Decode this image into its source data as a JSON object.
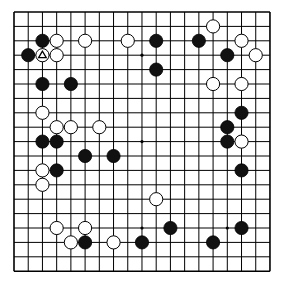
{
  "board": {
    "size": 19,
    "origin_x": 14,
    "origin_y": 12,
    "spacing_x": 14.22,
    "spacing_y": 14.4,
    "stone_radius": 6.6,
    "line_color": "#000000",
    "background": "#ffffff",
    "star_points": [
      [
        3,
        3
      ],
      [
        9,
        3
      ],
      [
        15,
        3
      ],
      [
        3,
        9
      ],
      [
        9,
        9
      ],
      [
        15,
        9
      ],
      [
        3,
        15
      ],
      [
        9,
        15
      ],
      [
        15,
        15
      ]
    ]
  },
  "stones": {
    "black": [
      [
        2,
        2
      ],
      [
        10,
        2
      ],
      [
        13,
        2
      ],
      [
        1,
        3
      ],
      [
        15,
        3
      ],
      [
        10,
        4
      ],
      [
        2,
        5
      ],
      [
        4,
        5
      ],
      [
        16,
        7
      ],
      [
        15,
        8
      ],
      [
        2,
        9
      ],
      [
        3,
        9
      ],
      [
        15,
        9
      ],
      [
        5,
        10
      ],
      [
        7,
        10
      ],
      [
        3,
        11
      ],
      [
        16,
        11
      ],
      [
        11,
        15
      ],
      [
        16,
        15
      ],
      [
        5,
        16
      ],
      [
        9,
        16
      ],
      [
        14,
        16
      ]
    ],
    "white": [
      [
        14,
        1
      ],
      [
        3,
        2
      ],
      [
        5,
        2
      ],
      [
        8,
        2
      ],
      [
        16,
        2
      ],
      [
        2,
        3
      ],
      [
        3,
        3
      ],
      [
        17,
        3
      ],
      [
        14,
        5
      ],
      [
        16,
        5
      ],
      [
        2,
        7
      ],
      [
        3,
        8
      ],
      [
        4,
        8
      ],
      [
        6,
        8
      ],
      [
        16,
        9
      ],
      [
        2,
        11
      ],
      [
        2,
        12
      ],
      [
        10,
        13
      ],
      [
        3,
        15
      ],
      [
        5,
        15
      ],
      [
        4,
        16
      ],
      [
        7,
        16
      ]
    ]
  },
  "markers": [
    {
      "type": "triangle",
      "col": 2,
      "row": 3,
      "on": "white"
    }
  ],
  "colors": {
    "black_stone": "#111111",
    "white_stone": "#ffffff",
    "stone_outline": "#000000"
  }
}
